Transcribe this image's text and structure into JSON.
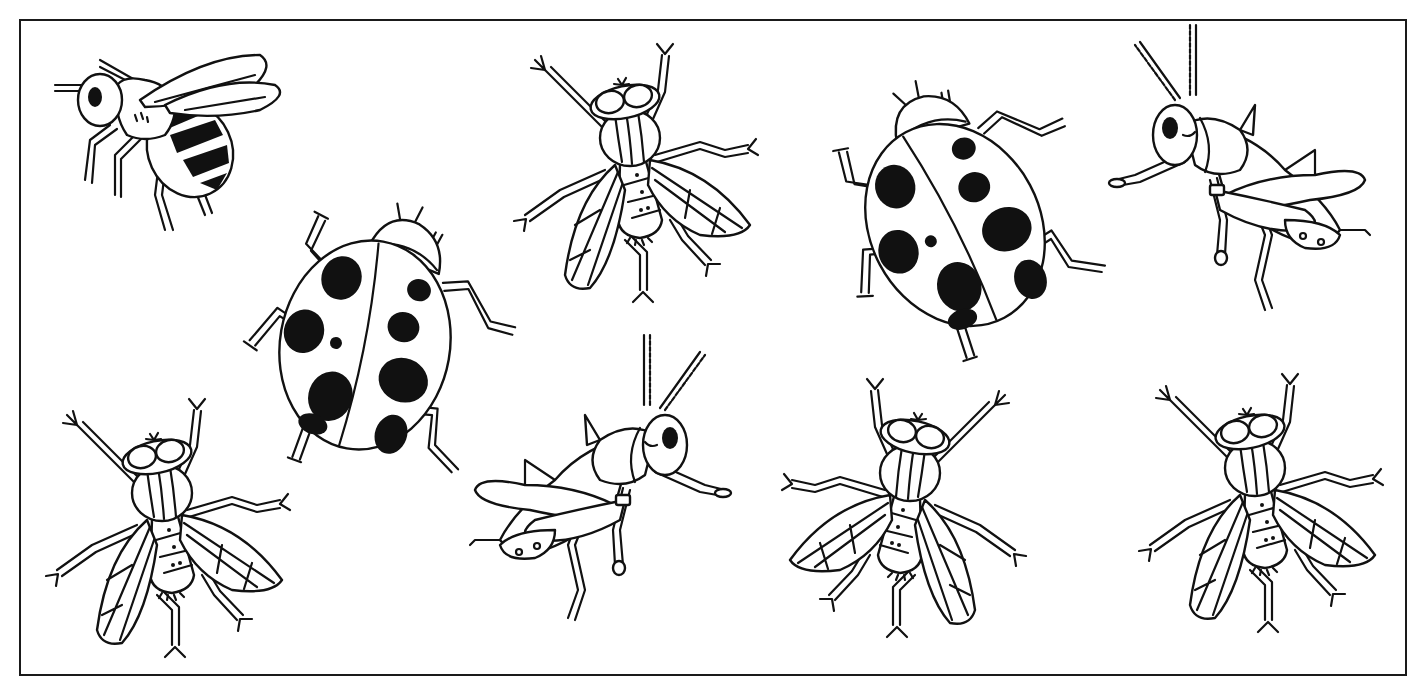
{
  "sheet": {
    "background": "#ffffff",
    "ink_color": "#111111",
    "frame": {
      "x": 19,
      "y": 19,
      "width": 1388,
      "height": 657
    }
  },
  "legend_counts": {
    "bee": 1,
    "fly": 4,
    "ladybug": 2,
    "grasshopper": 2
  },
  "insects": [
    {
      "id": "bee-1",
      "type": "bee",
      "cx": 165,
      "cy": 135,
      "scale": 1.0,
      "rotate": 0,
      "flip": false
    },
    {
      "id": "fly-1",
      "type": "fly",
      "cx": 630,
      "cy": 180,
      "scale": 1.0,
      "rotate": 0,
      "flip": false
    },
    {
      "id": "ladybug-1",
      "type": "ladybug",
      "cx": 955,
      "cy": 225,
      "scale": 1.0,
      "rotate": -18,
      "flip": false
    },
    {
      "id": "grasshopper-1",
      "type": "grasshopper",
      "cx": 1245,
      "cy": 190,
      "scale": 1.0,
      "rotate": 0,
      "flip": false
    },
    {
      "id": "ladybug-2",
      "type": "ladybug",
      "cx": 365,
      "cy": 345,
      "scale": 1.0,
      "rotate": 20,
      "flip": false
    },
    {
      "id": "fly-2",
      "type": "fly",
      "cx": 162,
      "cy": 535,
      "scale": 1.0,
      "rotate": 0,
      "flip": false
    },
    {
      "id": "grasshopper-2",
      "type": "grasshopper",
      "cx": 595,
      "cy": 500,
      "scale": 1.0,
      "rotate": 0,
      "flip": true
    },
    {
      "id": "fly-3",
      "type": "fly",
      "cx": 910,
      "cy": 515,
      "scale": 1.0,
      "rotate": 0,
      "flip": true
    },
    {
      "id": "fly-4",
      "type": "fly",
      "cx": 1255,
      "cy": 510,
      "scale": 1.0,
      "rotate": 0,
      "flip": false
    }
  ]
}
